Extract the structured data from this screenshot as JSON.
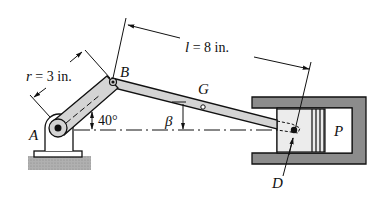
{
  "diagram": {
    "labels": {
      "A": "A",
      "B": "B",
      "G": "G",
      "D": "D",
      "P": "P",
      "beta": "β",
      "angle": "40°"
    },
    "dimensions": {
      "crank_symbol": "r",
      "crank_value": " = 3 in.",
      "rod_symbol": "l",
      "rod_value": " = 8 in."
    },
    "colors": {
      "ink": "#111111",
      "link_fill": "#d4d4d4",
      "housing_fill": "#8c8c8c",
      "ground_fill": "#a8a8a8",
      "piston_fill": "#ececec"
    }
  }
}
